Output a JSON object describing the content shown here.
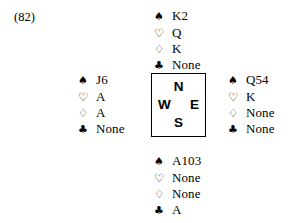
{
  "figure": {
    "label": "(82)"
  },
  "suits": {
    "spade": {
      "name": "spade-icon",
      "glyph": "♠"
    },
    "heart": {
      "name": "heart-icon",
      "glyph": "♡"
    },
    "diamond": {
      "name": "diamond-icon",
      "glyph": "♢"
    },
    "club": {
      "name": "club-icon",
      "glyph": "♣"
    }
  },
  "compass": {
    "north": "N",
    "west": "W",
    "east": "E",
    "south": "S"
  },
  "hands": {
    "north": {
      "position": "North",
      "spades": "K2",
      "hearts": "Q",
      "diamonds": "K",
      "clubs": "None"
    },
    "west": {
      "position": "West",
      "spades": "J6",
      "hearts": "A",
      "diamonds": "A",
      "clubs": "None"
    },
    "east": {
      "position": "East",
      "spades": "Q54",
      "hearts": "K",
      "diamonds": "None",
      "clubs": "None"
    },
    "south": {
      "position": "South",
      "spades": "A103",
      "hearts": "None",
      "diamonds": "None",
      "clubs": "A"
    }
  }
}
